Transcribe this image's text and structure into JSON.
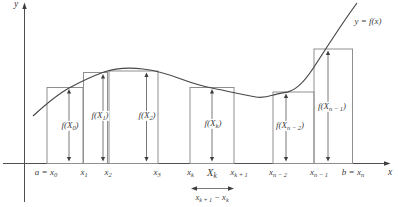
{
  "colors": {
    "background": "#ffffff",
    "ink": "#3d3d3d",
    "bar_stroke": "#8f8f8f",
    "curve_stroke": "#474747"
  },
  "axes": {
    "y_label": "y",
    "x_label": "x"
  },
  "curve": {
    "label": "y = f(x)"
  },
  "bar_height_labels": {
    "f_x0": [
      {
        "t": "f("
      },
      {
        "t": "X"
      },
      {
        "t": "0",
        "sub": true
      },
      {
        "t": ")"
      }
    ],
    "f_x1": [
      {
        "t": "f("
      },
      {
        "t": "X"
      },
      {
        "t": "1",
        "sub": true
      },
      {
        "t": ")"
      }
    ],
    "f_x2": [
      {
        "t": "f("
      },
      {
        "t": "X"
      },
      {
        "t": "2",
        "sub": true
      },
      {
        "t": ")"
      }
    ],
    "f_xk": [
      {
        "t": "f("
      },
      {
        "t": "X"
      },
      {
        "t": "k",
        "sub": true
      },
      {
        "t": ")"
      }
    ],
    "f_xn2": [
      {
        "t": "f("
      },
      {
        "t": "X"
      },
      {
        "t": "n − 2",
        "sub": true
      },
      {
        "t": ")"
      }
    ],
    "f_xn1": [
      {
        "t": "f("
      },
      {
        "t": "X"
      },
      {
        "t": "n − 1",
        "sub": true
      },
      {
        "t": ")"
      }
    ]
  },
  "tick_labels": {
    "a_x0": [
      {
        "t": "a = x"
      },
      {
        "t": "0",
        "sub": true
      }
    ],
    "x1": [
      {
        "t": "x"
      },
      {
        "t": "1",
        "sub": true
      }
    ],
    "x2": [
      {
        "t": "x"
      },
      {
        "t": "2",
        "sub": true
      }
    ],
    "x3": [
      {
        "t": "x"
      },
      {
        "t": "3",
        "sub": true
      }
    ],
    "xk": [
      {
        "t": "x"
      },
      {
        "t": "k",
        "sub": true
      }
    ],
    "Xk": [
      {
        "t": "X"
      },
      {
        "t": "k",
        "sub": true
      }
    ],
    "xk1": [
      {
        "t": "x"
      },
      {
        "t": "k + 1",
        "sub": true
      }
    ],
    "xn2": [
      {
        "t": "x"
      },
      {
        "t": "n − 2",
        "sub": true
      }
    ],
    "xn1": [
      {
        "t": "x"
      },
      {
        "t": "n − 1",
        "sub": true
      }
    ],
    "b_xn": [
      {
        "t": "b = x"
      },
      {
        "t": "n",
        "sub": true
      }
    ]
  },
  "width_label": [
    {
      "t": "x"
    },
    {
      "t": "k + 1",
      "sub": true
    },
    {
      "t": " − "
    },
    {
      "t": "x"
    },
    {
      "t": "k",
      "sub": true
    }
  ]
}
